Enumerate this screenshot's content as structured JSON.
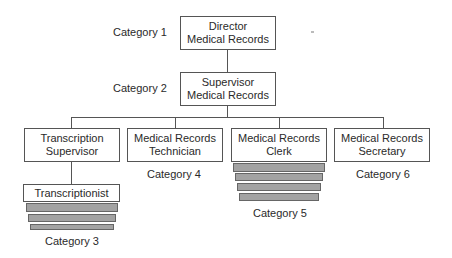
{
  "nodes": {
    "director": {
      "line1": "Director",
      "line2": "Medical Records"
    },
    "supervisor": {
      "line1": "Supervisor",
      "line2": "Medical Records"
    },
    "transcription_supervisor": {
      "line1": "Transcription",
      "line2": "Supervisor"
    },
    "technician": {
      "line1": "Medical Records",
      "line2": "Technician"
    },
    "clerk": {
      "line1": "Medical Records",
      "line2": "Clerk"
    },
    "secretary": {
      "line1": "Medical Records",
      "line2": "Secretary"
    },
    "transcriptionist": {
      "label": "Transcriptionist"
    }
  },
  "categories": {
    "c1": "Category 1",
    "c2": "Category 2",
    "c3": "Category 3",
    "c4": "Category 4",
    "c5": "Category 5",
    "c6": "Category 6"
  },
  "stacks": {
    "transcriptionist_bars": 3,
    "clerk_bars": 4
  },
  "colors": {
    "line": "#555555",
    "bar_fill": "#a3a3a3"
  }
}
